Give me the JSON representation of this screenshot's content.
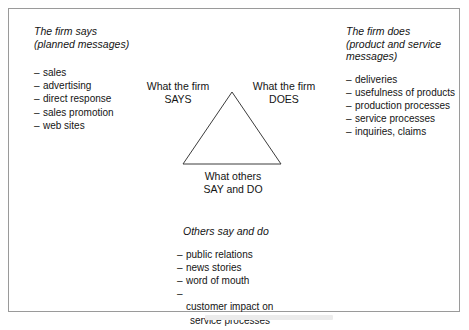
{
  "figure": {
    "border_color": "#9a9a9a",
    "background": "#ffffff",
    "line_color": "#3c3c3c"
  },
  "left_column": {
    "heading": "The firm says\n(planned messages)",
    "items": [
      "sales",
      "advertising",
      "direct response",
      "sales promotion",
      "web sites"
    ],
    "dash": "–"
  },
  "right_column": {
    "heading": "The firm does\n(product and service\nmessages)",
    "items": [
      "deliveries",
      "usefulness of products",
      "production processes",
      "service processes",
      "inquiries, claims"
    ],
    "dash": "–"
  },
  "triangle": {
    "label_left": "What the firm\nSAYS",
    "label_right": "What the firm\nDOES",
    "label_bottom": "What others\nSAY and DO"
  },
  "bottom_column": {
    "heading": "Others say and do",
    "items": [
      "public relations",
      "news stories",
      "word of mouth",
      "customer impact on"
    ],
    "last_item_continuation": "service processes",
    "dash": "–"
  }
}
